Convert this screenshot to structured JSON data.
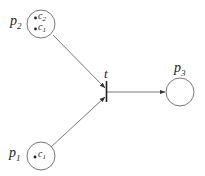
{
  "diagram": {
    "type": "petri-net",
    "places": [
      {
        "id": "p2",
        "label": "p",
        "sub": "2",
        "tokens": [
          {
            "label": "c",
            "sub": "2"
          },
          {
            "label": "c",
            "sub": "1"
          }
        ]
      },
      {
        "id": "p1",
        "label": "p",
        "sub": "1",
        "tokens": [
          {
            "label": "c",
            "sub": "1"
          }
        ]
      },
      {
        "id": "p3",
        "label": "p",
        "sub": "3",
        "tokens": []
      }
    ],
    "transitions": [
      {
        "id": "t",
        "label": "t"
      }
    ],
    "arcs": [
      {
        "from": "p2",
        "to": "t"
      },
      {
        "from": "p1",
        "to": "t"
      },
      {
        "from": "t",
        "to": "p3"
      }
    ]
  }
}
